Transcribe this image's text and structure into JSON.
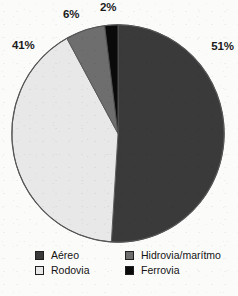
{
  "chart_data": {
    "type": "pie",
    "title": "",
    "subtitle": "",
    "xlabel": "",
    "ylabel": "",
    "grid": false,
    "legend_position": "bottom",
    "units": "percent",
    "total": 100,
    "center": {
      "x": 118,
      "y": 133
    },
    "radius": 107,
    "start_angle_deg": 0,
    "direction": "clockwise",
    "categories": [
      "Aéreo",
      "Rodovia",
      "Hidrovia/marítmo",
      "Ferrovia"
    ],
    "values": [
      51,
      41,
      6,
      2
    ],
    "colors": [
      "#3a3a3a",
      "#e8e8e8",
      "#6e6e6e",
      "#0a0a0a"
    ],
    "slices": [
      {
        "label": "Aéreo",
        "value": 51,
        "data_label": "51%",
        "color": "#3a3a3a",
        "start_angle_deg": 0,
        "end_angle_deg": 183.6
      },
      {
        "label": "Rodovia",
        "value": 41,
        "data_label": "41%",
        "color": "#e8e8e8",
        "start_angle_deg": 183.6,
        "end_angle_deg": 331.2
      },
      {
        "label": "Hidrovia/marítmo",
        "value": 6,
        "data_label": "6%",
        "color": "#6e6e6e",
        "start_angle_deg": 331.2,
        "end_angle_deg": 352.8
      },
      {
        "label": "Ferrovia",
        "value": 2,
        "data_label": "2%",
        "color": "#0a0a0a",
        "start_angle_deg": 352.8,
        "end_angle_deg": 360
      }
    ]
  },
  "labels": {
    "aereo_pct": "51%",
    "rodovia_pct": "41%",
    "hidrovia_pct": "6%",
    "ferrovia_pct": "2%"
  },
  "legend": {
    "items": [
      {
        "label": "Aéreo",
        "color": "#3a3a3a"
      },
      {
        "label": "Hidrovia/marítmo",
        "color": "#6e6e6e"
      },
      {
        "label": "Rodovia",
        "color": "#e8e8e8"
      },
      {
        "label": "Ferrovia",
        "color": "#0a0a0a"
      }
    ]
  },
  "style": {
    "background": "#fbfbfa",
    "outline": "#555555",
    "text": "#141414"
  }
}
